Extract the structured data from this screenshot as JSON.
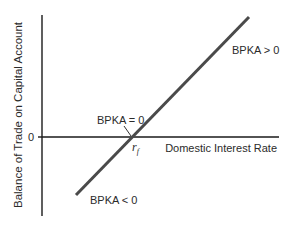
{
  "diagram": {
    "y_axis_label": "Balance of Trade on Capital Account",
    "x_axis_label": "Domestic Interest Rate",
    "origin_label": "0",
    "intersection_label": "r",
    "intersection_subscript": "f",
    "curve_labels": {
      "positive": "BPKA > 0",
      "zero": "BPKA = 0",
      "negative": "BPKA < 0"
    },
    "colors": {
      "axis": "#1a1a1a",
      "curve": "#4a4a4a",
      "text": "#2b2b2b"
    }
  }
}
